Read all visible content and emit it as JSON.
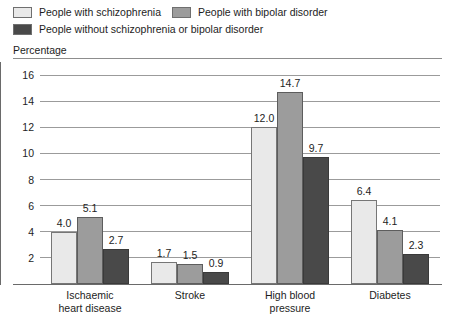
{
  "legend": {
    "entries": [
      {
        "label": "People with schizophrenia",
        "color": "#e9e9e9",
        "swatch_name": "legend-swatch-schizophrenia"
      },
      {
        "label": "People with bipolar disorder",
        "color": "#9c9c9c",
        "swatch_name": "legend-swatch-bipolar"
      },
      {
        "label": "People without schizophrenia or bipolar disorder",
        "color": "#494949",
        "swatch_name": "legend-swatch-neither"
      }
    ]
  },
  "axis_title": "Percentage",
  "chart_data": {
    "type": "bar",
    "title": "",
    "subtitle": "",
    "xlabel": "",
    "ylabel": "Percentage",
    "ylim": [
      0,
      17
    ],
    "yticks": [
      2,
      4,
      6,
      8,
      10,
      12,
      14,
      16
    ],
    "ytick_labels": [
      "2",
      "4",
      "6",
      "8",
      "10",
      "12",
      "14",
      "16"
    ],
    "grid": true,
    "legend_position": "top-left",
    "categories": [
      "Ischaemic heart disease",
      "Stroke",
      "High blood pressure",
      "Diabetes"
    ],
    "category_lines": [
      [
        "Ischaemic",
        "heart disease"
      ],
      [
        "Stroke"
      ],
      [
        "High blood",
        "pressure"
      ],
      [
        "Diabetes"
      ]
    ],
    "series": [
      {
        "name": "People with schizophrenia",
        "color": "#e9e9e9",
        "values": [
          4.0,
          1.7,
          12.0,
          6.4
        ],
        "labels": [
          "4.0",
          "1.7",
          "12.0",
          "6.4"
        ]
      },
      {
        "name": "People with bipolar disorder",
        "color": "#9c9c9c",
        "values": [
          5.1,
          1.5,
          14.7,
          4.1
        ],
        "labels": [
          "5.1",
          "1.5",
          "14.7",
          "4.1"
        ]
      },
      {
        "name": "People without schizophrenia or bipolar disorder",
        "color": "#494949",
        "values": [
          2.7,
          0.9,
          9.7,
          2.3
        ],
        "labels": [
          "2.7",
          "0.9",
          "9.7",
          "2.3"
        ]
      }
    ]
  }
}
